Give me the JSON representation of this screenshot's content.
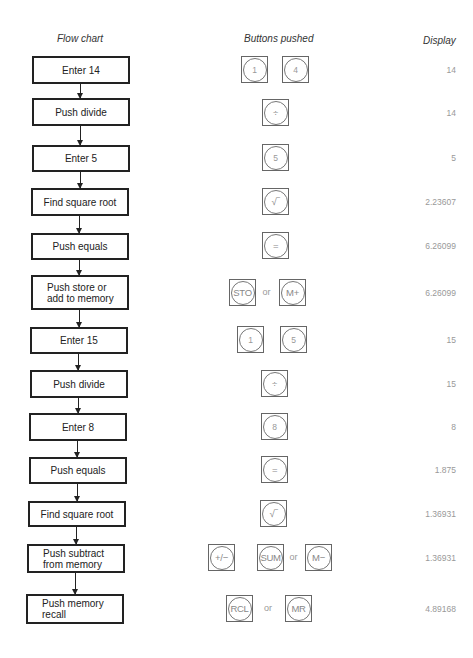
{
  "headers": {
    "flow": "Flow chart",
    "buttons": "Buttons pushed",
    "display": "Display"
  },
  "steps": [
    {
      "label": "Enter 14",
      "keys": [
        "1",
        "4"
      ],
      "or_after": [],
      "display": "14"
    },
    {
      "label": "Push divide",
      "keys": [
        "÷"
      ],
      "display": "14"
    },
    {
      "label": "Enter 5",
      "keys": [
        "5"
      ],
      "display": "5"
    },
    {
      "label": "Find square root",
      "keys": [
        "√‾"
      ],
      "display": "2.23607"
    },
    {
      "label": "Push equals",
      "keys": [
        "="
      ],
      "display": "6.26099"
    },
    {
      "label": "Push store or\nadd to memory",
      "keys": [
        "STO",
        "M+"
      ],
      "or": "or",
      "display": "6.26099"
    },
    {
      "label": "Enter 15",
      "keys": [
        "1",
        "5"
      ],
      "display": "15"
    },
    {
      "label": "Push divide",
      "keys": [
        "÷"
      ],
      "display": "15"
    },
    {
      "label": "Enter 8",
      "keys": [
        "8"
      ],
      "display": "8"
    },
    {
      "label": "Push equals",
      "keys": [
        "="
      ],
      "display": "1.875"
    },
    {
      "label": "Find square root",
      "keys": [
        "√‾"
      ],
      "display": "1.36931"
    },
    {
      "label": "Push subtract\nfrom memory",
      "keys": [
        "+/−",
        "SUM",
        "M−"
      ],
      "or": "or",
      "display": "1.36931"
    },
    {
      "label": "Push memory\nrecall",
      "keys": [
        "RCL",
        "MR"
      ],
      "or": "or",
      "display": "4.89168"
    }
  ]
}
